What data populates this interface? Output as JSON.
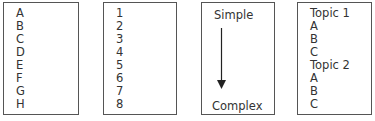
{
  "boxes": {
    "letters": {
      "items": [
        "A",
        "B",
        "C",
        "D",
        "E",
        "F",
        "G",
        "H"
      ]
    },
    "numbers": {
      "items": [
        "1",
        "2",
        "3",
        "4",
        "5",
        "6",
        "7",
        "8"
      ]
    },
    "progression": {
      "top_label": "Simple",
      "bottom_label": "Complex",
      "icon": "down-arrow-icon"
    },
    "topics": {
      "items": [
        "Topic 1",
        "A",
        "B",
        "C",
        "Topic 2",
        "A",
        "B",
        "C"
      ]
    }
  },
  "colors": {
    "border": "#555555",
    "text": "#333333",
    "arrow": "#222222"
  }
}
